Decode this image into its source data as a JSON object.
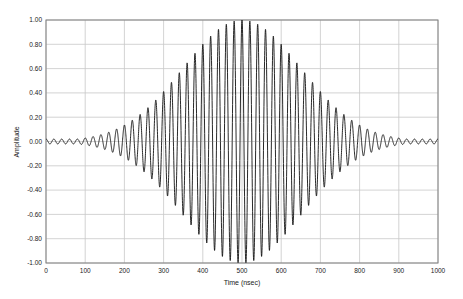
{
  "chart_data": {
    "type": "line",
    "title": "",
    "xlabel": "Time (nsec)",
    "ylabel": "Amplitude",
    "xlim": [
      0,
      1000
    ],
    "ylim": [
      -1.0,
      1.0
    ],
    "x_ticks": [
      "0",
      "100",
      "200",
      "300",
      "400",
      "500",
      "600",
      "700",
      "800",
      "900",
      "1000"
    ],
    "y_ticks": [
      "1.00",
      "0.80",
      "0.60",
      "0.40",
      "0.20",
      "0.00",
      "-0.20",
      "-0.40",
      "-0.60",
      "-0.80",
      "-1.00"
    ],
    "grid": true,
    "legend": null,
    "series": [
      {
        "name": "Gaussian-windowed sinusoid",
        "description": "Sinusoidal carrier (~50 MHz, period ~20 nsec) modulated by a Gaussian-like envelope centered at 500 nsec",
        "carrier_period_nsec": 20,
        "envelope_center_nsec": 500,
        "envelope_sigma_nsec": 150,
        "peak_amplitude": 1.0,
        "envelope_samples": {
          "x": [
            0,
            100,
            200,
            300,
            400,
            500,
            600,
            700,
            800,
            900,
            1000
          ],
          "y": [
            0.02,
            0.04,
            0.16,
            0.44,
            0.8,
            1.0,
            0.8,
            0.44,
            0.16,
            0.04,
            0.02
          ]
        }
      }
    ],
    "colors": {
      "line": "#111111",
      "grid": "#c8c8c8",
      "frame": "#808080"
    }
  }
}
